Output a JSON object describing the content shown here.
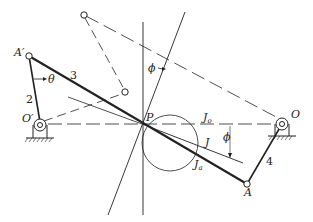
{
  "figure": {
    "type": "four-bar linkage instant-center diagram",
    "labels": {
      "A_prime": "A′",
      "A": "A",
      "O_prime": "O′",
      "O": "O",
      "P": "P",
      "theta": "θ",
      "phi_top": "ϕ",
      "phi_right": "ϕ",
      "J": "J",
      "J0": "J",
      "J0_sub": "o",
      "Ja": "J",
      "Ja_sub": "a",
      "link2": "2",
      "link3": "3",
      "link4": "4"
    },
    "colors": {
      "ink": "#222222",
      "background": "#ffffff"
    }
  }
}
